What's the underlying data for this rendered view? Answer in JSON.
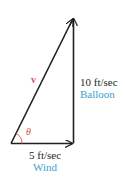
{
  "diagram": {
    "resultant": {
      "label": "v",
      "color": "#d9534a"
    },
    "angle": {
      "label": "θ",
      "color": "#d9534a"
    },
    "vertical": {
      "magnitude": "10 ft/sec",
      "name": "Balloon",
      "name_color": "#3aa0d0"
    },
    "horizontal": {
      "magnitude": "5 ft/sec",
      "name": "Wind",
      "name_color": "#3aa0d0"
    },
    "line_color": "#231f20"
  }
}
